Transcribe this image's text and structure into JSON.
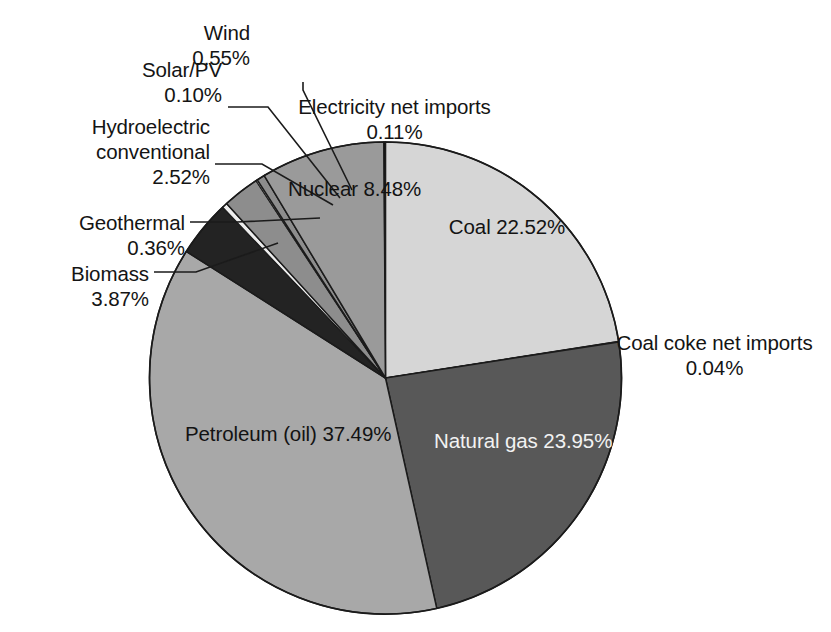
{
  "chart_data": {
    "type": "pie",
    "title": "",
    "xlabel": "",
    "ylabel": "",
    "legend_position": "none",
    "grid": false,
    "units": "percent",
    "total": 100.0,
    "start_angle_deg": 0,
    "direction": "clockwise",
    "categories": [
      "Coal",
      "Coal coke net imports",
      "Natural gas",
      "Petroleum (oil)",
      "Biomass",
      "Geothermal",
      "Hydroelectric conventional",
      "Solar/PV",
      "Wind",
      "Nuclear",
      "Electricity net imports"
    ],
    "values": [
      22.52,
      0.04,
      23.95,
      37.49,
      3.87,
      0.36,
      2.52,
      0.1,
      0.55,
      8.48,
      0.11
    ],
    "value_labels": [
      "22.52%",
      "0.04%",
      "23.95%",
      "37.49%",
      "3.87%",
      "0.36%",
      "2.52%",
      "0.10%",
      "0.55%",
      "8.48%",
      "0.11%"
    ],
    "slice_colors": [
      "#d6d6d6",
      "#f4f4f4",
      "#585858",
      "#a8a8a8",
      "#232323",
      "#ededed",
      "#8d8d8d",
      "#ededed",
      "#8d8d8d",
      "#9a9a9a",
      "#101010"
    ],
    "slices": [
      {
        "name": "Coal",
        "value": 22.52,
        "label": "Coal",
        "value_label": "22.52%",
        "color": "#d6d6d6",
        "label_placement": "inside",
        "text_color": "dark"
      },
      {
        "name": "Coal coke net imports",
        "value": 0.04,
        "label": "Coal coke net imports",
        "value_label": "0.04%",
        "color": "#f4f4f4",
        "label_placement": "outside",
        "text_color": "dark"
      },
      {
        "name": "Natural gas",
        "value": 23.95,
        "label": "Natural gas",
        "value_label": "23.95%",
        "color": "#585858",
        "label_placement": "inside",
        "text_color": "light"
      },
      {
        "name": "Petroleum (oil)",
        "value": 37.49,
        "label": "Petroleum (oil)",
        "value_label": "37.49%",
        "color": "#a8a8a8",
        "label_placement": "inside",
        "text_color": "dark"
      },
      {
        "name": "Biomass",
        "value": 3.87,
        "label": "Biomass",
        "value_label": "3.87%",
        "color": "#232323",
        "label_placement": "leader",
        "text_color": "dark"
      },
      {
        "name": "Geothermal",
        "value": 0.36,
        "label": "Geothermal",
        "value_label": "0.36%",
        "color": "#ededed",
        "label_placement": "leader",
        "text_color": "dark"
      },
      {
        "name": "Hydroelectric conventional",
        "value": 2.52,
        "label": "Hydroelectric conventional",
        "value_label": "2.52%",
        "color": "#8d8d8d",
        "label_placement": "leader",
        "text_color": "dark"
      },
      {
        "name": "Solar/PV",
        "value": 0.1,
        "label": "Solar/PV",
        "value_label": "0.10%",
        "color": "#ededed",
        "label_placement": "leader",
        "text_color": "dark"
      },
      {
        "name": "Wind",
        "value": 0.55,
        "label": "Wind",
        "value_label": "0.55%",
        "color": "#8d8d8d",
        "label_placement": "leader",
        "text_color": "dark"
      },
      {
        "name": "Nuclear",
        "value": 8.48,
        "label": "Nuclear",
        "value_label": "8.48%",
        "color": "#9a9a9a",
        "label_placement": "inside",
        "text_color": "dark"
      },
      {
        "name": "Electricity net imports",
        "value": 0.11,
        "label": "Electricity net imports",
        "value_label": "0.11%",
        "color": "#101010",
        "label_placement": "outside",
        "text_color": "dark"
      }
    ]
  },
  "labels": {
    "wind": {
      "line1": "Wind",
      "line2": "0.55%"
    },
    "solar": {
      "line1": "Solar/PV",
      "line2": "0.10%"
    },
    "hydro": {
      "line1": "Hydroelectric",
      "line2": "conventional",
      "line3": "2.52%"
    },
    "geothermal": {
      "line1": "Geothermal",
      "line2": "0.36%"
    },
    "biomass": {
      "line1": "Biomass",
      "line2": "3.87%"
    },
    "electricity": {
      "line1": "Electricity net imports",
      "line2": "0.11%"
    },
    "coalcoke": {
      "line1": "Coal coke net imports",
      "line2": "0.04%"
    },
    "nuclear": {
      "line1": "Nuclear",
      "line2": "8.48%"
    },
    "coal": {
      "line1": "Coal",
      "line2": "22.52%"
    },
    "naturalgas": {
      "line1": "Natural gas",
      "line2": "23.95%"
    },
    "petroleum": {
      "line1": "Petroleum (oil)",
      "line2": "37.49%"
    }
  }
}
